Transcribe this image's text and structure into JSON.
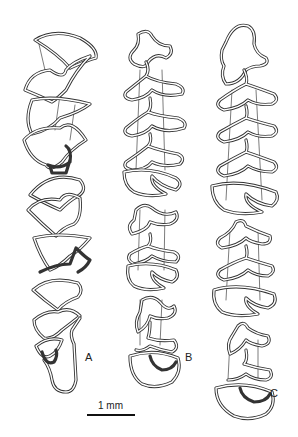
{
  "figure": {
    "specimens": [
      {
        "id": "A",
        "label": "A",
        "segments": 3
      },
      {
        "id": "B",
        "label": "B",
        "segments": 3
      },
      {
        "id": "C",
        "label": "C",
        "segments": 3
      }
    ],
    "scale_bar": {
      "label": "1 mm",
      "length_px": 48
    },
    "colors": {
      "line": "#333333",
      "background": "#ffffff"
    }
  }
}
